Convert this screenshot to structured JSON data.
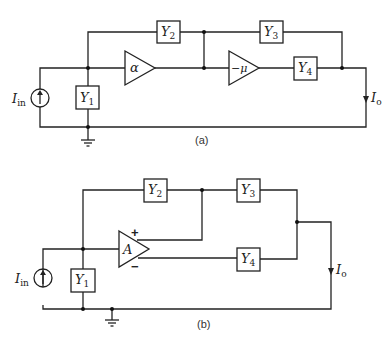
{
  "figure": {
    "circuit_a": {
      "caption": "(a)",
      "source": {
        "label": "I",
        "subscript": "in"
      },
      "output": {
        "label": "I",
        "subscript": "o"
      },
      "admittances": [
        {
          "label": "Y",
          "subscript": "1"
        },
        {
          "label": "Y",
          "subscript": "2"
        },
        {
          "label": "Y",
          "subscript": "3"
        },
        {
          "label": "Y",
          "subscript": "4"
        }
      ],
      "amplifiers": [
        {
          "gain": "α"
        },
        {
          "gain": "−μ"
        }
      ]
    },
    "circuit_b": {
      "caption": "(b)",
      "source": {
        "label": "I",
        "subscript": "in"
      },
      "output": {
        "label": "I",
        "subscript": "o"
      },
      "admittances": [
        {
          "label": "Y",
          "subscript": "1"
        },
        {
          "label": "Y",
          "subscript": "2"
        },
        {
          "label": "Y",
          "subscript": "3"
        },
        {
          "label": "Y",
          "subscript": "4"
        }
      ],
      "amplifier": {
        "gain": "A",
        "plus": "+",
        "minus": "−"
      }
    }
  }
}
